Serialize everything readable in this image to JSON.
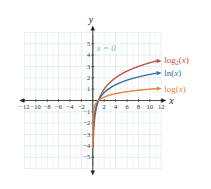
{
  "chart_data": {
    "type": "line",
    "title": "",
    "xlabel": "x",
    "ylabel": "y",
    "xlim": [
      -12,
      12
    ],
    "ylim": [
      -6,
      6
    ],
    "grid": true,
    "x_ticks": [
      "-12",
      "-10",
      "-8",
      "-6",
      "-4",
      "-2",
      "2",
      "4",
      "6",
      "8",
      "10",
      "12"
    ],
    "y_ticks": [
      "5",
      "4",
      "3",
      "2",
      "1",
      "-1",
      "-2",
      "-3",
      "-4",
      "-5"
    ],
    "annotations": [
      {
        "text": "x = 0",
        "color": "#7fbf7f",
        "note": "vertical asymptote"
      }
    ],
    "series": [
      {
        "name": "log2(x)",
        "label_main": "log",
        "label_sub": "2",
        "label_arg": "(x)",
        "color": "#c0504d",
        "points": [
          [
            0.0625,
            -4
          ],
          [
            0.125,
            -3
          ],
          [
            0.25,
            -2
          ],
          [
            0.5,
            -1
          ],
          [
            1,
            0
          ],
          [
            2,
            1
          ],
          [
            4,
            2
          ],
          [
            8,
            3
          ],
          [
            11,
            3.46
          ]
        ]
      },
      {
        "name": "ln(x)",
        "label_main": "ln",
        "label_sub": "",
        "label_arg": "(x)",
        "color": "#2e6f9e",
        "points": [
          [
            0.05,
            -3
          ],
          [
            0.135,
            -2
          ],
          [
            0.368,
            -1
          ],
          [
            1,
            0
          ],
          [
            2.718,
            1
          ],
          [
            7.389,
            2
          ],
          [
            11,
            2.4
          ]
        ]
      },
      {
        "name": "log(x)",
        "label_main": "log",
        "label_sub": "",
        "label_arg": "(x)",
        "color": "#e8843a",
        "points": [
          [
            0.001,
            -3
          ],
          [
            0.01,
            -2
          ],
          [
            0.1,
            -1
          ],
          [
            1,
            0
          ],
          [
            10,
            1
          ],
          [
            11,
            1.04
          ]
        ]
      }
    ]
  }
}
